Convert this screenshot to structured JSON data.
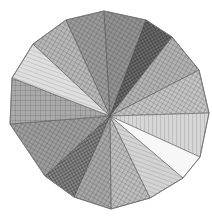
{
  "artwork": {
    "description": "Pencil-drawn polygonal disc divided into radial wedges with cross-hatched shading",
    "center": [
      110,
      116
    ],
    "vertices": [
      [
        66,
        20
      ],
      [
        104,
        11
      ],
      [
        146,
        20
      ],
      [
        172,
        37
      ],
      [
        199,
        70
      ],
      [
        209,
        113
      ],
      [
        200,
        157
      ],
      [
        183,
        178
      ],
      [
        150,
        198
      ],
      [
        111,
        209
      ],
      [
        74,
        197
      ],
      [
        45,
        176
      ],
      [
        10,
        124
      ],
      [
        12,
        78
      ],
      [
        33,
        44
      ]
    ],
    "wedges": [
      {
        "fill": "#7a7a7a",
        "hatch": "cross"
      },
      {
        "fill": "#6e6e6e",
        "hatch": "cross"
      },
      {
        "fill": "#3a3a3a",
        "hatch": "dense"
      },
      {
        "fill": "#9a9a9a",
        "hatch": "cross"
      },
      {
        "fill": "#b0b0b0",
        "hatch": "cross"
      },
      {
        "fill": "#c8c8c8",
        "hatch": "vertical"
      },
      {
        "fill": "#f4f4f4",
        "hatch": "none"
      },
      {
        "fill": "#c4c4c4",
        "hatch": "horizontal"
      },
      {
        "fill": "#a8a8a8",
        "hatch": "cross"
      },
      {
        "fill": "#8a8a8a",
        "hatch": "cross"
      },
      {
        "fill": "#5c5c5c",
        "hatch": "dense"
      },
      {
        "fill": "#7c7c7c",
        "hatch": "cross"
      },
      {
        "fill": "#8c8c8c",
        "hatch": "grid"
      },
      {
        "fill": "#d4d4d4",
        "hatch": "horizontal"
      },
      {
        "fill": "#a2a2a2",
        "hatch": "cross"
      }
    ],
    "colors": {
      "background": "#ffffff",
      "stroke": "#555555"
    }
  }
}
